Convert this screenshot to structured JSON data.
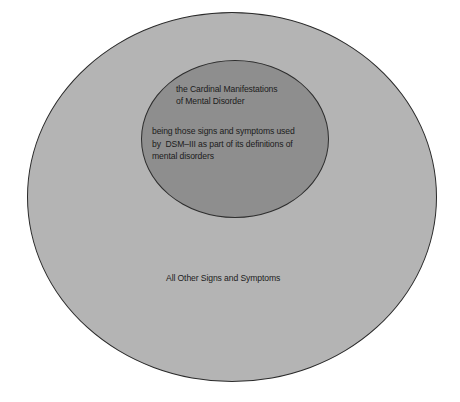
{
  "diagram": {
    "type": "nested-set (Venn/Euler) diagram",
    "outer_set": {
      "label": "All Other Signs and Symptoms",
      "fill": "#b4b4b4"
    },
    "inner_set": {
      "title_lines": [
        "the Cardinal Manifestations",
        "of Mental Disorder"
      ],
      "description_lines": [
        "being those signs and symptoms used",
        "by  DSM–III as part of its definitions of",
        "mental disorders"
      ],
      "fill": "#8e8e8e"
    },
    "stroke_color": "#2a2a2a",
    "background": "#ffffff"
  }
}
